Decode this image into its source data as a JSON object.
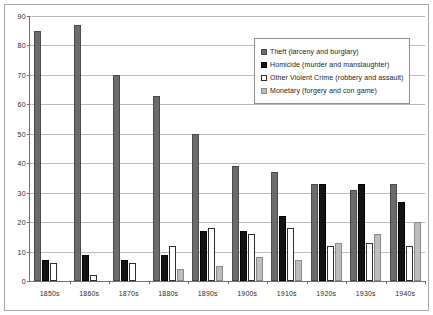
{
  "chart_data": {
    "type": "bar",
    "title": "",
    "subtitle": "",
    "xlabel": "",
    "ylabel": "",
    "ylim": [
      0,
      90
    ],
    "ytick_step": 10,
    "yticks": [
      0,
      10,
      20,
      30,
      40,
      50,
      60,
      70,
      80,
      90
    ],
    "grid": true,
    "legend_position": "top-right",
    "categories": [
      "1850s",
      "1860s",
      "1870s",
      "1880s",
      "1890s",
      "1900s",
      "1910s",
      "1920s",
      "1930s",
      "1940s"
    ],
    "series": [
      {
        "name": "Theft (larceny and burglary)",
        "color": "#6b6b6b",
        "values": [
          85,
          87,
          70,
          63,
          50,
          39,
          37,
          33,
          31,
          33
        ]
      },
      {
        "name": "Homicide (murder and manslaughter)",
        "color": "#121212",
        "values": [
          7,
          9,
          7,
          9,
          17,
          17,
          22,
          33,
          33,
          27
        ]
      },
      {
        "name": "Other Violent Crime (robbery and assault)",
        "color": "#ffffff",
        "values": [
          6,
          2,
          6,
          12,
          18,
          16,
          18,
          12,
          13,
          12
        ]
      },
      {
        "name": "Monetary (forgery and con game)",
        "color": "#bdbdbd",
        "values": [
          0,
          0,
          0,
          4,
          5,
          8,
          7,
          13,
          16,
          20
        ]
      }
    ]
  },
  "legend": {
    "items": [
      {
        "label": "Theft  (larceny and burglary)"
      },
      {
        "label": "Homicide  (murder and manslaughter)"
      },
      {
        "label": "Other Violent Crime (robbery and assault)"
      },
      {
        "label": "Monetary  (forgery and con game)"
      }
    ]
  }
}
